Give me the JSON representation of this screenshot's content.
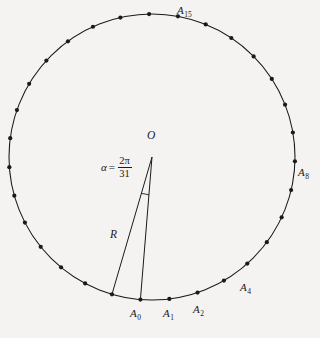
{
  "figure": {
    "type": "geometry-diagram",
    "background_color": "#f4f3f1",
    "stroke_color": "#1a1a1a"
  },
  "circle": {
    "center_x": 152,
    "center_y": 157,
    "radius": 143,
    "vertex_count": 31,
    "vertex_dot_radius": 2.1,
    "start_angle_deg": 94.645
  },
  "center_point": {
    "label": "O",
    "x": 152,
    "y": 157,
    "label_x": 147,
    "label_y": 130
  },
  "radius_segment": {
    "label": "R",
    "label_x": 110,
    "label_y": 229
  },
  "angle": {
    "symbol": "α",
    "equals": "=",
    "numerator": "2π",
    "denominator": "31",
    "value_text": "α = 2π/31",
    "arc_radius": 38
  },
  "vertex_labels": [
    {
      "name": "A0",
      "base": "A",
      "sub": "0",
      "index": 0,
      "x": 130,
      "y": 308
    },
    {
      "name": "A1",
      "base": "A",
      "sub": "1",
      "index": 1,
      "x": 163,
      "y": 308
    },
    {
      "name": "A2",
      "base": "A",
      "sub": "2",
      "index": 2,
      "x": 193,
      "y": 304
    },
    {
      "name": "A4",
      "base": "A",
      "sub": "4",
      "index": 4,
      "x": 240,
      "y": 282
    },
    {
      "name": "A8",
      "base": "A",
      "sub": "8",
      "index": 8,
      "x": 298,
      "y": 167
    },
    {
      "name": "A15",
      "base": "A",
      "sub": "15",
      "index": 15,
      "x": 177,
      "y": 5
    }
  ],
  "triangle": {
    "apex": "O",
    "base_left": "A0",
    "base_right": "A1"
  }
}
